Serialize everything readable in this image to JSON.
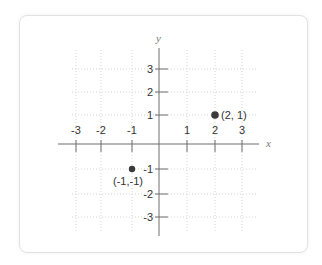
{
  "diagram": {
    "type": "coordinate-plane",
    "axes": {
      "x_label": "x",
      "y_label": "y",
      "x_ticks": [
        "-3",
        "-2",
        "-1",
        "1",
        "2",
        "3"
      ],
      "y_ticks": [
        "3",
        "2",
        "1",
        "-1",
        "-2",
        "-3"
      ]
    },
    "points": [
      {
        "x": 2,
        "y": 1,
        "label": "(2, 1)"
      },
      {
        "x": -1,
        "y": -1,
        "label": "(-1,-1)"
      }
    ],
    "colors": {
      "axis": "#6e6e6e",
      "grid": "#d4d4d4",
      "point": "#3a3a3a",
      "text": "#333333"
    }
  }
}
